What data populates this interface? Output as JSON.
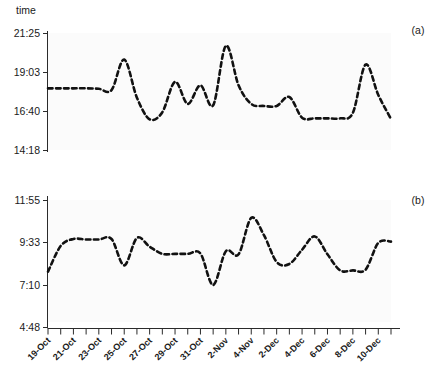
{
  "figure": {
    "y_axis_unit_label": "time",
    "panel_tags": [
      "(a)",
      "(b)"
    ]
  },
  "chart_data": {
    "type": "line",
    "title": "",
    "subtitle": "",
    "xlabel": "",
    "ylabel": "time",
    "grid": false,
    "legend_position": "none",
    "panels": [
      {
        "tag": "(a)",
        "ylabel": "time",
        "ytick_labels": [
          "21:25",
          "19:03",
          "16:40",
          "14:18"
        ],
        "ytick_values": [
          21.4167,
          19.05,
          16.6667,
          14.3
        ],
        "ylim": [
          13.6,
          22.1
        ],
        "x": [
          "19-Oct",
          "20-Oct",
          "21-Oct",
          "22-Oct",
          "23-Oct",
          "24-Oct",
          "25-Oct",
          "26-Oct",
          "27-Oct",
          "28-Oct",
          "29-Oct",
          "30-Oct",
          "31-Oct",
          "1-Nov",
          "2-Nov",
          "3-Nov",
          "4-Nov",
          "5-Nov",
          "2-Dec",
          "3-Dec",
          "4-Dec",
          "5-Dec",
          "6-Dec",
          "7-Dec",
          "8-Dec",
          "9-Dec",
          "10-Dec",
          "11-Dec"
        ],
        "values": [
          18.08,
          18.08,
          18.08,
          18.08,
          18.05,
          17.95,
          20.17,
          17.4,
          15.83,
          16.35,
          18.55,
          16.95,
          18.3,
          16.85,
          21.17,
          18.3,
          16.95,
          16.8,
          16.8,
          17.45,
          15.95,
          15.9,
          15.9,
          15.9,
          16.3,
          19.8,
          17.6,
          15.85
        ],
        "value_labels": [
          "18:05",
          "18:05",
          "18:05",
          "18:05",
          "18:03",
          "17:57",
          "20:10",
          "17:24",
          "15:50",
          "16:21",
          "18:33",
          "16:57",
          "18:18",
          "16:51",
          "21:10",
          "18:18",
          "16:57",
          "16:48",
          "16:48",
          "17:27",
          "15:57",
          "15:54",
          "15:54",
          "15:54",
          "16:18",
          "19:48",
          "17:36",
          "15:51"
        ]
      },
      {
        "tag": "(b)",
        "ylabel": "time",
        "ytick_labels": [
          "11:55",
          "9:33",
          "7:10",
          "4:48"
        ],
        "ytick_values": [
          11.9167,
          9.55,
          7.1667,
          4.8
        ],
        "ylim": [
          4.3,
          12.6
        ],
        "x": [
          "19-Oct",
          "20-Oct",
          "21-Oct",
          "22-Oct",
          "23-Oct",
          "24-Oct",
          "25-Oct",
          "26-Oct",
          "27-Oct",
          "28-Oct",
          "29-Oct",
          "30-Oct",
          "31-Oct",
          "1-Nov",
          "2-Nov",
          "3-Nov",
          "4-Nov",
          "5-Nov",
          "2-Dec",
          "3-Dec",
          "4-Dec",
          "5-Dec",
          "6-Dec",
          "7-Dec",
          "8-Dec",
          "9-Dec",
          "10-Dec",
          "11-Dec"
        ],
        "values": [
          7.92,
          9.6,
          10.05,
          10.02,
          10.02,
          10.05,
          8.33,
          10.12,
          9.55,
          9.08,
          9.08,
          9.08,
          9.1,
          7.05,
          9.25,
          9.05,
          11.43,
          10.3,
          8.55,
          8.42,
          9.35,
          10.22,
          9.05,
          8.0,
          8.0,
          8.05,
          9.8,
          9.88
        ],
        "value_labels": [
          "7:55",
          "9:36",
          "10:03",
          "10:01",
          "10:01",
          "10:03",
          "8:20",
          "10:07",
          "9:33",
          "9:05",
          "9:05",
          "9:05",
          "9:06",
          "7:03",
          "9:15",
          "9:03",
          "11:26",
          "10:18",
          "8:33",
          "8:25",
          "9:21",
          "10:13",
          "9:03",
          "8:00",
          "8:00",
          "8:03",
          "9:48",
          "9:53"
        ]
      }
    ],
    "xtick_labels": [
      "19-Oct",
      "21-Oct",
      "23-Oct",
      "25-Oct",
      "27-Oct",
      "29-Oct",
      "31-Oct",
      "2-Nov",
      "4-Nov",
      "2-Dec",
      "4-Dec",
      "6-Dec",
      "8-Dec",
      "10-Dec"
    ]
  }
}
